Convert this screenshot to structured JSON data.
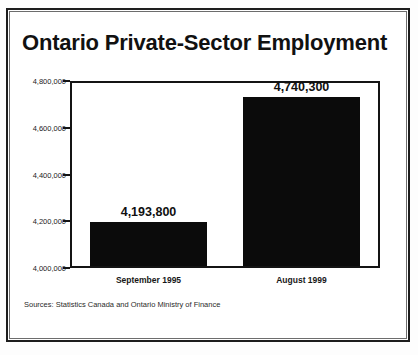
{
  "chart_data": {
    "type": "bar",
    "title": "Ontario Private-Sector Employment",
    "categories": [
      "September 1995",
      "August 1999"
    ],
    "values": [
      4193800,
      4740300
    ],
    "value_labels": [
      "4,193,800",
      "4,740,300"
    ],
    "xlabel": "",
    "ylabel": "",
    "ylim": [
      4000000,
      4800000
    ],
    "ytick_labels": [
      "4,800,000",
      "4,600,000",
      "4,400,000",
      "4,200,000",
      "4,000,000"
    ],
    "ytick_values": [
      4800000,
      4600000,
      4400000,
      4200000,
      4000000
    ],
    "grid": false,
    "legend": false,
    "bar_color": "#0b0b0b",
    "frame_color": "#141414",
    "source_note": "Sources:  Statistics Canada and Ontario Ministry of Finance"
  }
}
